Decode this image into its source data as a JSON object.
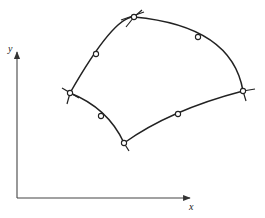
{
  "figure": {
    "axes": {
      "x_label": "x",
      "y_label": "y",
      "origin": [
        17,
        198
      ],
      "x_end": [
        192,
        198
      ],
      "y_end": [
        17,
        50
      ]
    },
    "corner_nodes": [
      {
        "id": "top",
        "pos": [
          134,
          17
        ]
      },
      {
        "id": "right",
        "pos": [
          243,
          91
        ]
      },
      {
        "id": "bottom",
        "pos": [
          124,
          143
        ]
      },
      {
        "id": "left",
        "pos": [
          70,
          93
        ]
      }
    ],
    "midside_nodes": [
      {
        "id": "top-left-mid",
        "pos": [
          96,
          54
        ]
      },
      {
        "id": "top-right-mid",
        "pos": [
          198,
          37
        ]
      },
      {
        "id": "bottom-right-mid",
        "pos": [
          178,
          114
        ]
      },
      {
        "id": "bottom-left-mid",
        "pos": [
          101,
          116
        ]
      }
    ],
    "colors": {
      "stroke": "#222222",
      "background": "#ffffff",
      "node_fill": "#ffffff"
    }
  }
}
